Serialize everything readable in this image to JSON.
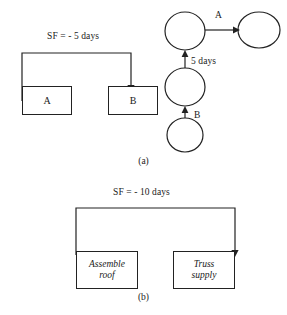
{
  "figure": {
    "panels": [
      {
        "id": "panel-a",
        "caption": "(a)",
        "precedence": {
          "link_label": "SF = - 5 days",
          "boxes": [
            {
              "id": "box-a",
              "label": "A"
            },
            {
              "id": "box-b",
              "label": "B"
            }
          ]
        },
        "network": {
          "arrow_labels": [
            {
              "id": "arrow-a",
              "label": "A"
            },
            {
              "id": "arrow-duration",
              "label": "5 days"
            },
            {
              "id": "arrow-b",
              "label": "B"
            }
          ],
          "node_count": 4
        }
      },
      {
        "id": "panel-b",
        "caption": "(b)",
        "precedence": {
          "link_label": "SF = - 10 days",
          "boxes": [
            {
              "id": "box-assemble-roof",
              "label_line1": "Assemble",
              "label_line2": "roof"
            },
            {
              "id": "box-truss-supply",
              "label_line1": "Truss",
              "label_line2": "supply"
            }
          ]
        }
      }
    ],
    "colors": {
      "ink": "#222222",
      "paper": "#ffffff"
    }
  }
}
